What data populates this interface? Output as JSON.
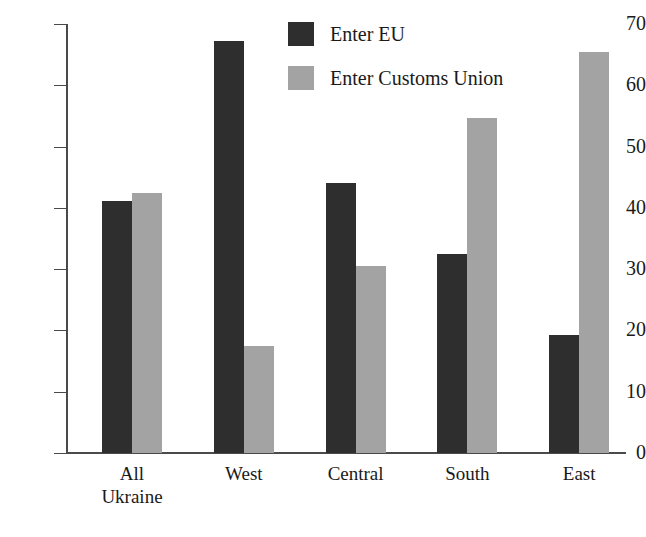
{
  "chart_data": {
    "type": "bar",
    "title": "",
    "subtitle": "",
    "xlabel": "",
    "ylabel": "",
    "ylim": [
      0,
      70
    ],
    "ytick_labels": [
      "0",
      "10",
      "20",
      "30",
      "40",
      "50",
      "60",
      "70"
    ],
    "ytick_values": [
      0,
      10,
      20,
      30,
      40,
      50,
      60,
      70
    ],
    "grid": false,
    "legend_position": "top-center",
    "categories": [
      "All Ukraine",
      "West",
      "Central",
      "South",
      "East"
    ],
    "category_lines": [
      [
        "All",
        "Ukraine"
      ],
      [
        "West"
      ],
      [
        "Central"
      ],
      [
        "South"
      ],
      [
        "East"
      ]
    ],
    "series": [
      {
        "name": "Enter EU",
        "color": "#2e2e2e",
        "values": [
          41.2,
          67.3,
          44.1,
          32.5,
          19.3
        ]
      },
      {
        "name": "Enter Customs Union",
        "color": "#a3a3a3",
        "values": [
          42.5,
          17.5,
          30.5,
          54.6,
          65.5
        ]
      }
    ]
  },
  "legend": {
    "items": [
      {
        "label": "Enter EU",
        "color": "#2e2e2e"
      },
      {
        "label": "Enter Customs Union",
        "color": "#a3a3a3"
      }
    ]
  },
  "colors": {
    "series_dark": "#2e2e2e",
    "series_light": "#a3a3a3",
    "axis": "#4a4a4a",
    "text": "#1a1a1a",
    "background": "#ffffff"
  }
}
